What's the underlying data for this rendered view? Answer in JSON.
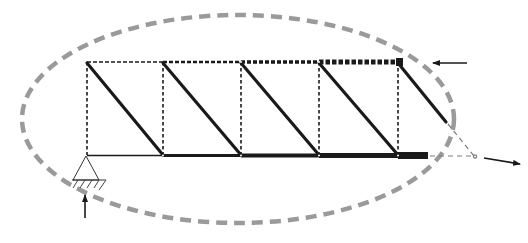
{
  "diagram": {
    "colors": {
      "member": "#1a1a1a",
      "ellipse": "#9a9a9a",
      "extension": "#7a7a7a",
      "background": "#ffffff"
    },
    "nodes_x": [
      87,
      163,
      241,
      319,
      398
    ],
    "top_chord_y": 62,
    "bottom_chord_y": 156,
    "elements": {
      "ellipse": "dashed-boundary-ellipse",
      "top_chord": "dashed top chord (thickening toward right)",
      "bottom_chord": "solid bottom chord (thickening toward right)",
      "verticals": "dashed vertical members",
      "diagonals": "solid diagonal members",
      "support": "pin-support",
      "reaction_arrow": "upward reaction force",
      "top_load_arrow": "leftward force at top right",
      "bottom_load_arrow": "rightward force at bottom right",
      "extension": "dashed extension triangle at right end"
    }
  }
}
